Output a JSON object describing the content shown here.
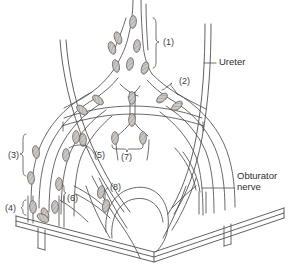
{
  "figure": {
    "type": "anatomical-line-diagram",
    "background_color": "#ffffff",
    "line_color": "#4a4a4a",
    "node_fill_color": "#b9b4b0",
    "text_color": "#333333"
  },
  "labels": {
    "numbered": [
      {
        "id": "1",
        "text": "(1)",
        "x": 163,
        "y": 42,
        "bracket": true
      },
      {
        "id": "2",
        "text": "(2)",
        "x": 176,
        "y": 80,
        "bracket": true
      },
      {
        "id": "3",
        "text": "(3)",
        "x": 10,
        "y": 155,
        "bracket": true
      },
      {
        "id": "4",
        "text": "(4)",
        "x": 5,
        "y": 207,
        "bracket": true
      },
      {
        "id": "5",
        "text": "(5)",
        "x": 95,
        "y": 153,
        "bracket": false
      },
      {
        "id": "6",
        "text": "(6)",
        "x": 66,
        "y": 196,
        "bracket": true
      },
      {
        "id": "7",
        "text": "(7)",
        "x": 122,
        "y": 150,
        "bracket": true
      },
      {
        "id": "8",
        "text": "(8)",
        "x": 113,
        "y": 183,
        "bracket": false
      }
    ],
    "named": [
      {
        "id": "ureter",
        "lines": [
          "Ureter"
        ],
        "x": 218,
        "y": 59,
        "leader_from_x": 205,
        "leader_to_x": 215,
        "leader_y": 63
      },
      {
        "id": "obturator-nerve",
        "lines": [
          "Obturator",
          "nerve"
        ],
        "x": 237,
        "y": 177,
        "leader_from_x": 203,
        "leader_to_x": 234,
        "leader_y": 188
      }
    ]
  }
}
